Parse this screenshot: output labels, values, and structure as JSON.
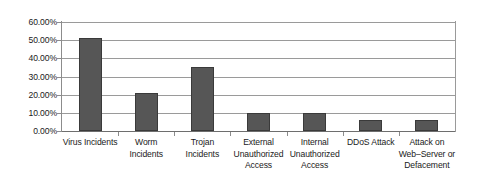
{
  "chart_data": {
    "type": "bar",
    "title": "",
    "subtitle": "",
    "xlabel": "",
    "ylabel": "",
    "ylim": [
      0,
      60
    ],
    "grid": true,
    "legend": false,
    "value_suffix": "%",
    "categories": [
      "Virus Incidents",
      "Worm Incidents",
      "Trojan Incidents",
      "External Unauthorized Access",
      "Internal Unauthorized Access",
      "DDoS Attack",
      "Attack on Web–Server or Defacement"
    ],
    "category_lines": [
      [
        "Virus Incidents"
      ],
      [
        "Worm",
        "Incidents"
      ],
      [
        "Trojan",
        "Incidents"
      ],
      [
        "External",
        "Unauthorized",
        "Access"
      ],
      [
        "Internal",
        "Unauthorized",
        "Access"
      ],
      [
        "DDoS Attack"
      ],
      [
        "Attack on",
        "Web–Server or",
        "Defacement"
      ]
    ],
    "values": [
      51.0,
      21.0,
      35.0,
      10.0,
      10.0,
      6.0,
      6.0
    ],
    "ytick_labels": [
      "60.00%",
      "50.00%",
      "40.00%",
      "30.00%",
      "20.00%",
      "10.00%",
      "0.00%"
    ],
    "ytick_values": [
      60,
      50,
      40,
      30,
      20,
      10,
      0
    ],
    "colors": {
      "bar_fill": "#565656",
      "bar_stroke": "#3a3a3a",
      "gridline": "#9a9a9a",
      "axis": "#8c8c8c",
      "text": "#1a1a1a",
      "background": "#ffffff"
    }
  }
}
